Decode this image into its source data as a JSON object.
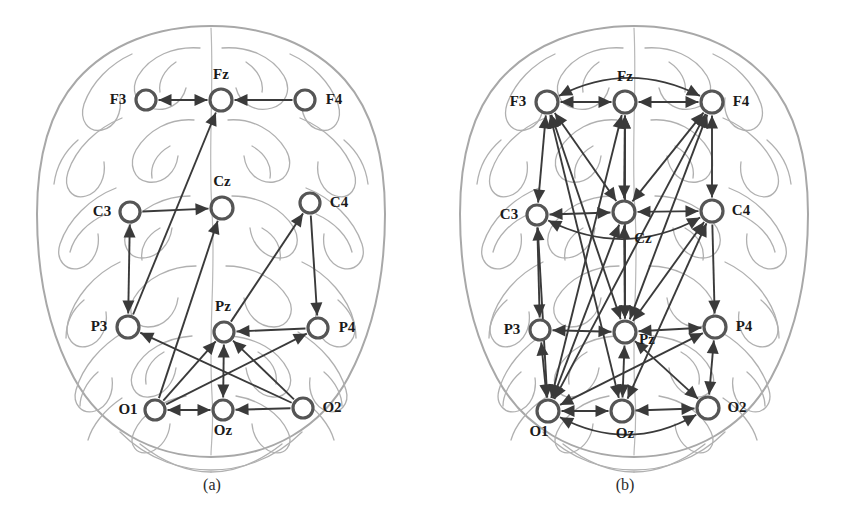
{
  "figure": {
    "background_color": "#ffffff",
    "edge_color": "#3a3a3a",
    "node_stroke_color": "#555555",
    "brain_outline_color": "#a8a8a8",
    "label_color": "#1a1a1a"
  },
  "panels": [
    {
      "id": "a",
      "caption": "(a)",
      "caption_x": 212,
      "caption_y": 490,
      "nodes": [
        {
          "id": "F3",
          "label": "F3",
          "cx": 146,
          "cy": 100,
          "r": 10,
          "label_x": 118,
          "label_y": 104,
          "anchor": "middle"
        },
        {
          "id": "Fz",
          "label": "Fz",
          "cx": 221,
          "cy": 100,
          "r": 11,
          "label_x": 221,
          "label_y": 79,
          "anchor": "middle"
        },
        {
          "id": "F4",
          "label": "F4",
          "cx": 305,
          "cy": 100,
          "r": 10,
          "label_x": 334,
          "label_y": 104,
          "anchor": "middle"
        },
        {
          "id": "C3",
          "label": "C3",
          "cx": 130,
          "cy": 212,
          "r": 10,
          "label_x": 102,
          "label_y": 216,
          "anchor": "middle"
        },
        {
          "id": "Cz",
          "label": "Cz",
          "cx": 222,
          "cy": 208,
          "r": 11,
          "label_x": 222,
          "label_y": 186,
          "anchor": "middle"
        },
        {
          "id": "C4",
          "label": "C4",
          "cx": 310,
          "cy": 203,
          "r": 10,
          "label_x": 339,
          "label_y": 207,
          "anchor": "middle"
        },
        {
          "id": "P3",
          "label": "P3",
          "cx": 128,
          "cy": 327,
          "r": 11,
          "label_x": 99,
          "label_y": 331,
          "anchor": "middle"
        },
        {
          "id": "Pz",
          "label": "Pz",
          "cx": 224,
          "cy": 332,
          "r": 10,
          "label_x": 223,
          "label_y": 311,
          "anchor": "middle"
        },
        {
          "id": "P4",
          "label": "P4",
          "cx": 318,
          "cy": 328,
          "r": 10,
          "label_x": 347,
          "label_y": 332,
          "anchor": "middle"
        },
        {
          "id": "O1",
          "label": "O1",
          "cx": 155,
          "cy": 410,
          "r": 10,
          "label_x": 128,
          "label_y": 414,
          "anchor": "middle"
        },
        {
          "id": "Oz",
          "label": "Oz",
          "cx": 223,
          "cy": 410,
          "r": 10,
          "label_x": 223,
          "label_y": 435,
          "anchor": "middle"
        },
        {
          "id": "O2",
          "label": "O2",
          "cx": 303,
          "cy": 408,
          "r": 10,
          "label_x": 332,
          "label_y": 412,
          "anchor": "middle"
        }
      ],
      "edges": [
        {
          "from": "F3",
          "to": "Fz",
          "dir": "both",
          "curve": 0
        },
        {
          "from": "F4",
          "to": "Fz",
          "dir": "forward",
          "curve": 0
        },
        {
          "from": "P3",
          "to": "Fz",
          "dir": "forward",
          "curve": 0
        },
        {
          "from": "C3",
          "to": "Cz",
          "dir": "forward",
          "curve": 0
        },
        {
          "from": "C3",
          "to": "P3",
          "dir": "both",
          "curve": 0
        },
        {
          "from": "O1",
          "to": "Cz",
          "dir": "forward",
          "curve": 0
        },
        {
          "from": "C4",
          "to": "P4",
          "dir": "forward",
          "curve": 0
        },
        {
          "from": "Pz",
          "to": "C4",
          "dir": "forward",
          "curve": 0
        },
        {
          "from": "P4",
          "to": "Pz",
          "dir": "forward",
          "curve": 0
        },
        {
          "from": "Pz",
          "to": "Oz",
          "dir": "both",
          "curve": 0
        },
        {
          "from": "O1",
          "to": "Oz",
          "dir": "both",
          "curve": 0
        },
        {
          "from": "O2",
          "to": "Oz",
          "dir": "forward",
          "curve": 0
        },
        {
          "from": "O1",
          "to": "Pz",
          "dir": "forward",
          "curve": 0
        },
        {
          "from": "O1",
          "to": "P4",
          "dir": "forward",
          "curve": 0
        },
        {
          "from": "O2",
          "to": "Pz",
          "dir": "forward",
          "curve": 0
        },
        {
          "from": "O2",
          "to": "P3",
          "dir": "forward",
          "curve": 0
        }
      ]
    },
    {
      "id": "b",
      "caption": "(b)",
      "caption_x": 202,
      "caption_y": 490,
      "nodes": [
        {
          "id": "F3",
          "label": "F3",
          "cx": 124,
          "cy": 102,
          "r": 11,
          "label_x": 95,
          "label_y": 106,
          "anchor": "middle"
        },
        {
          "id": "Fz",
          "label": "Fz",
          "cx": 202,
          "cy": 102,
          "r": 11,
          "label_x": 202,
          "label_y": 81,
          "anchor": "middle"
        },
        {
          "id": "F4",
          "label": "F4",
          "cx": 289,
          "cy": 102,
          "r": 11,
          "label_x": 318,
          "label_y": 106,
          "anchor": "middle"
        },
        {
          "id": "C3",
          "label": "C3",
          "cx": 114,
          "cy": 215,
          "r": 10,
          "label_x": 86,
          "label_y": 219,
          "anchor": "middle"
        },
        {
          "id": "Cz",
          "label": "Cz",
          "cx": 201,
          "cy": 212,
          "r": 11,
          "label_x": 220,
          "label_y": 243,
          "anchor": "middle"
        },
        {
          "id": "C4",
          "label": "C4",
          "cx": 289,
          "cy": 211,
          "r": 11,
          "label_x": 318,
          "label_y": 215,
          "anchor": "middle"
        },
        {
          "id": "P3",
          "label": "P3",
          "cx": 117,
          "cy": 330,
          "r": 10,
          "label_x": 89,
          "label_y": 334,
          "anchor": "middle"
        },
        {
          "id": "Pz",
          "label": "Pz",
          "cx": 202,
          "cy": 332,
          "r": 11,
          "label_x": 224,
          "label_y": 344,
          "anchor": "middle"
        },
        {
          "id": "P4",
          "label": "P4",
          "cx": 292,
          "cy": 327,
          "r": 11,
          "label_x": 321,
          "label_y": 331,
          "anchor": "middle"
        },
        {
          "id": "O1",
          "label": "O1",
          "cx": 125,
          "cy": 411,
          "r": 11,
          "label_x": 116,
          "label_y": 436,
          "anchor": "middle"
        },
        {
          "id": "Oz",
          "label": "Oz",
          "cx": 199,
          "cy": 411,
          "r": 11,
          "label_x": 202,
          "label_y": 438,
          "anchor": "middle"
        },
        {
          "id": "O2",
          "label": "O2",
          "cx": 285,
          "cy": 408,
          "r": 11,
          "label_x": 314,
          "label_y": 412,
          "anchor": "middle"
        }
      ],
      "edges": [
        {
          "from": "F3",
          "to": "Fz",
          "dir": "both",
          "curve": 0
        },
        {
          "from": "Fz",
          "to": "F4",
          "dir": "both",
          "curve": 0
        },
        {
          "from": "F3",
          "to": "F4",
          "dir": "both",
          "curve": -42
        },
        {
          "from": "F3",
          "to": "C3",
          "dir": "both",
          "curve": 0
        },
        {
          "from": "Fz",
          "to": "Cz",
          "dir": "both",
          "curve": 0
        },
        {
          "from": "F4",
          "to": "C4",
          "dir": "both",
          "curve": 0
        },
        {
          "from": "F3",
          "to": "Cz",
          "dir": "both",
          "curve": 0
        },
        {
          "from": "F4",
          "to": "Cz",
          "dir": "both",
          "curve": 0
        },
        {
          "from": "F3",
          "to": "Pz",
          "dir": "both",
          "curve": 0
        },
        {
          "from": "Fz",
          "to": "Pz",
          "dir": "both",
          "curve": 0
        },
        {
          "from": "F4",
          "to": "Pz",
          "dir": "both",
          "curve": 0
        },
        {
          "from": "F3",
          "to": "Oz",
          "dir": "both",
          "curve": 0
        },
        {
          "from": "Fz",
          "to": "O1",
          "dir": "both",
          "curve": 0
        },
        {
          "from": "F4",
          "to": "O1",
          "dir": "both",
          "curve": 0
        },
        {
          "from": "Cz",
          "to": "C3",
          "dir": "both",
          "curve": 0
        },
        {
          "from": "Cz",
          "to": "C4",
          "dir": "both",
          "curve": 0
        },
        {
          "from": "C3",
          "to": "C4",
          "dir": "both",
          "curve": 46
        },
        {
          "from": "C3",
          "to": "P3",
          "dir": "forward",
          "curve": 0
        },
        {
          "from": "Cz",
          "to": "Pz",
          "dir": "both",
          "curve": 0
        },
        {
          "from": "C4",
          "to": "P4",
          "dir": "forward",
          "curve": 0
        },
        {
          "from": "C3",
          "to": "O1",
          "dir": "both",
          "curve": 0
        },
        {
          "from": "Cz",
          "to": "O1",
          "dir": "both",
          "curve": 0
        },
        {
          "from": "Pz",
          "to": "C4",
          "dir": "both",
          "curve": 0
        },
        {
          "from": "Oz",
          "to": "C4",
          "dir": "both",
          "curve": 0
        },
        {
          "from": "P3",
          "to": "Pz",
          "dir": "both",
          "curve": 0
        },
        {
          "from": "Pz",
          "to": "P4",
          "dir": "both",
          "curve": 0
        },
        {
          "from": "P3",
          "to": "O1",
          "dir": "both",
          "curve": 0
        },
        {
          "from": "Pz",
          "to": "Oz",
          "dir": "both",
          "curve": 0
        },
        {
          "from": "P4",
          "to": "O2",
          "dir": "both",
          "curve": 0
        },
        {
          "from": "P4",
          "to": "O1",
          "dir": "both",
          "curve": 0
        },
        {
          "from": "Pz",
          "to": "O2",
          "dir": "both",
          "curve": 0
        },
        {
          "from": "O1",
          "to": "Oz",
          "dir": "both",
          "curve": 0
        },
        {
          "from": "Oz",
          "to": "O2",
          "dir": "both",
          "curve": 0
        },
        {
          "from": "O1",
          "to": "O2",
          "dir": "both",
          "curve": 44
        }
      ]
    }
  ]
}
